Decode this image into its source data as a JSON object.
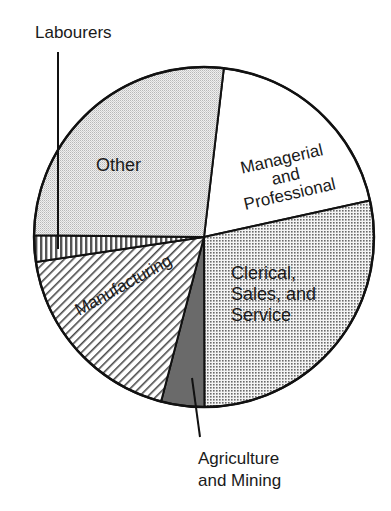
{
  "chart_data": {
    "type": "pie",
    "title": "",
    "start_angle_deg": 6.7,
    "direction": "clockwise",
    "slices": [
      {
        "label": "Managerial and Professional",
        "value": 19.7,
        "pattern": "blank",
        "fill": "#ffffff"
      },
      {
        "label": "Clerical, Sales, and Service",
        "value": 28.4,
        "pattern": "dot-grid",
        "fill": "#bdbdbd"
      },
      {
        "label": "Agriculture and Mining",
        "value": 4.1,
        "pattern": "solid",
        "fill": "#6a6a6a"
      },
      {
        "label": "Manufacturing",
        "value": 18.6,
        "pattern": "diagonal-hatch",
        "fill": "#ffffff"
      },
      {
        "label": "Labourers",
        "value": 2.5,
        "pattern": "vertical-stripes",
        "fill": "#ffffff"
      },
      {
        "label": "Other",
        "value": 26.7,
        "pattern": "fine-stipple",
        "fill": "#e4e4e4"
      }
    ],
    "legend": "none (direct labels)",
    "units": "percent (estimated from slice angles)"
  },
  "labels": {
    "managerial": [
      "Managerial",
      "and",
      "Professional"
    ],
    "clerical": [
      "Clerical,",
      "Sales, and",
      "Service"
    ],
    "agriculture": [
      "Agriculture",
      "and Mining"
    ],
    "manufacturing": "Manufacturing",
    "labourers": "Labourers",
    "other": "Other"
  },
  "geometry": {
    "cx": 204,
    "cy": 237,
    "r": 170
  }
}
